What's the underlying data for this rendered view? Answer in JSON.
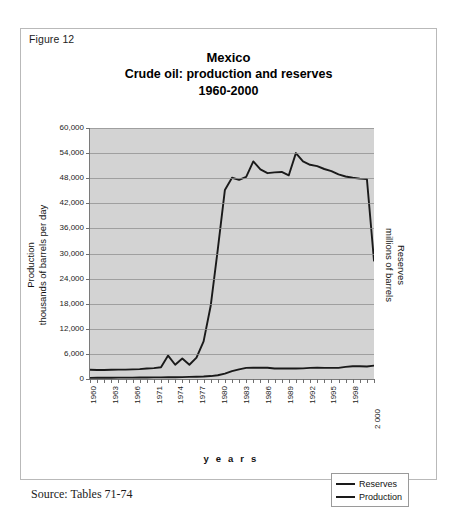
{
  "figure": {
    "label": "Figure 12",
    "source_note": "Source: Tables 71-74"
  },
  "title": {
    "line1": "Mexico",
    "line2": "Crude oil: production and reserves",
    "line3": "1960-2000"
  },
  "axes": {
    "left_title_line1": "Production",
    "left_title_line2": "thousands of barrels per day",
    "right_title_line1": "Reserves",
    "right_title_line2": "millions of barrels",
    "x_title": "y e a r s"
  },
  "legend": {
    "items": [
      {
        "label": "Reserves",
        "color": "#1a1a1a"
      },
      {
        "label": "Production",
        "color": "#1a1a1a"
      }
    ]
  },
  "chart_data": {
    "type": "line",
    "xlabel": "years",
    "ylabel": "Production thousands of barrels per day",
    "y2label": "Reserves millions of barrels",
    "ylim": [
      0,
      60000
    ],
    "ytick_values": [
      0,
      6000,
      12000,
      18000,
      24000,
      30000,
      36000,
      42000,
      48000,
      54000,
      60000
    ],
    "ytick_labels": [
      "0",
      "6,000",
      "12,000",
      "18,000",
      "24,000",
      "30,000",
      "36,000",
      "42,000",
      "48,000",
      "54,000",
      "60,000"
    ],
    "grid": true,
    "legend_position": "bottom-right",
    "plot_background": "#d3d3d3",
    "x": [
      1960,
      1961,
      1962,
      1963,
      1964,
      1965,
      1966,
      1967,
      1968,
      1969,
      1970,
      1971,
      1972,
      1973,
      1974,
      1975,
      1976,
      1977,
      1978,
      1979,
      1980,
      1981,
      1982,
      1983,
      1984,
      1985,
      1986,
      1987,
      1988,
      1989,
      1990,
      1991,
      1992,
      1993,
      1994,
      1995,
      1996,
      1997,
      1998,
      1999,
      2000
    ],
    "xtick_labels": [
      "1960",
      "1963",
      "1966",
      "1971",
      "1974",
      "1977",
      "1980",
      "1983",
      "1986",
      "1989",
      "1992",
      "1995",
      "1998",
      "2 000"
    ],
    "series": [
      {
        "name": "Reserves",
        "color": "#1a1a1a",
        "values": [
          2200,
          2150,
          2150,
          2200,
          2250,
          2250,
          2300,
          2350,
          2500,
          2600,
          2800,
          5600,
          3400,
          4900,
          3400,
          5100,
          9000,
          17500,
          31000,
          45200,
          48100,
          47600,
          48300,
          52000,
          50100,
          49200,
          49400,
          49500,
          48700,
          54000,
          52000,
          51200,
          50900,
          50200,
          49700,
          48900,
          48400,
          48100,
          47900,
          47800,
          28300
        ]
      },
      {
        "name": "Production",
        "color": "#1a1a1a",
        "values": [
          280,
          290,
          300,
          310,
          320,
          330,
          340,
          350,
          360,
          380,
          400,
          420,
          430,
          450,
          500,
          550,
          600,
          700,
          900,
          1300,
          1900,
          2300,
          2650,
          2700,
          2700,
          2700,
          2500,
          2500,
          2500,
          2500,
          2550,
          2650,
          2700,
          2650,
          2650,
          2650,
          2900,
          3050,
          3050,
          3000,
          3200
        ]
      }
    ]
  }
}
